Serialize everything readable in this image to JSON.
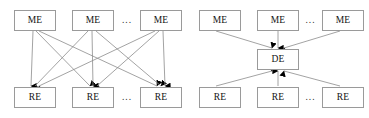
{
  "figure": {
    "type": "diagram",
    "background_color": "#ffffff",
    "box_border_color": "#9a9a9a",
    "edge_color": "#8c8c8c",
    "arrowhead_color": "#000000",
    "text_color": "#121212"
  },
  "labels": {
    "me": "ME",
    "re": "RE",
    "de": "DE",
    "ellipsis": "..."
  },
  "panels": [
    {
      "id": "left-panel",
      "name": "fully-connected-diagram",
      "top_nodes": [
        {
          "id": "L-ME-1",
          "label": "ME",
          "x": 14,
          "y": 10,
          "w": 42,
          "h": 21
        },
        {
          "id": "L-ME-2",
          "label": "ME",
          "x": 72,
          "y": 10,
          "w": 42,
          "h": 21
        },
        {
          "id": "L-ME-3",
          "label": "ME",
          "x": 140,
          "y": 10,
          "w": 42,
          "h": 21
        }
      ],
      "bottom_nodes": [
        {
          "id": "L-RE-1",
          "label": "RE",
          "x": 14,
          "y": 87,
          "w": 42,
          "h": 21
        },
        {
          "id": "L-RE-2",
          "label": "RE",
          "x": 72,
          "y": 87,
          "w": 42,
          "h": 21
        },
        {
          "id": "L-RE-3",
          "label": "RE",
          "x": 140,
          "y": 87,
          "w": 42,
          "h": 21
        }
      ],
      "ellipses": [
        {
          "id": "L-top-ellipsis",
          "label": "...",
          "x": 116,
          "y": 10,
          "w": 22,
          "h": 21
        },
        {
          "id": "L-bottom-ellipsis",
          "label": "...",
          "x": 116,
          "y": 87,
          "w": 22,
          "h": 21
        }
      ],
      "edges": [
        {
          "from": "L-ME-1",
          "to": "L-RE-1",
          "arrow": "end"
        },
        {
          "from": "L-ME-1",
          "to": "L-RE-2",
          "arrow": "end"
        },
        {
          "from": "L-ME-1",
          "to": "L-RE-3",
          "arrow": "end"
        },
        {
          "from": "L-ME-2",
          "to": "L-RE-1",
          "arrow": "end"
        },
        {
          "from": "L-ME-2",
          "to": "L-RE-2",
          "arrow": "end"
        },
        {
          "from": "L-ME-2",
          "to": "L-RE-3",
          "arrow": "end"
        },
        {
          "from": "L-ME-3",
          "to": "L-RE-1",
          "arrow": "end"
        },
        {
          "from": "L-ME-3",
          "to": "L-RE-2",
          "arrow": "end"
        },
        {
          "from": "L-ME-3",
          "to": "L-RE-3",
          "arrow": "end"
        }
      ],
      "edge_count": 9
    },
    {
      "id": "right-panel",
      "name": "hub-mediated-diagram",
      "top_nodes": [
        {
          "id": "R-ME-1",
          "label": "ME",
          "x": 199,
          "y": 10,
          "w": 42,
          "h": 21
        },
        {
          "id": "R-ME-2",
          "label": "ME",
          "x": 257,
          "y": 10,
          "w": 42,
          "h": 21
        },
        {
          "id": "R-ME-3",
          "label": "ME",
          "x": 322,
          "y": 10,
          "w": 42,
          "h": 21
        }
      ],
      "hub_node": {
        "id": "R-DE",
        "label": "DE",
        "x": 257,
        "y": 49,
        "w": 42,
        "h": 21
      },
      "bottom_nodes": [
        {
          "id": "R-RE-1",
          "label": "RE",
          "x": 199,
          "y": 87,
          "w": 42,
          "h": 21
        },
        {
          "id": "R-RE-2",
          "label": "RE",
          "x": 257,
          "y": 87,
          "w": 42,
          "h": 21
        },
        {
          "id": "R-RE-3",
          "label": "RE",
          "x": 322,
          "y": 87,
          "w": 42,
          "h": 21
        }
      ],
      "ellipses": [
        {
          "id": "R-top-ellipsis",
          "label": "...",
          "x": 300,
          "y": 10,
          "w": 21,
          "h": 21
        },
        {
          "id": "R-bottom-ellipsis",
          "label": "...",
          "x": 300,
          "y": 87,
          "w": 21,
          "h": 21
        }
      ],
      "edges": [
        {
          "from": "R-ME-1",
          "to": "R-DE",
          "arrow": "end"
        },
        {
          "from": "R-ME-2",
          "to": "R-DE",
          "arrow": "end"
        },
        {
          "from": "R-ME-3",
          "to": "R-DE",
          "arrow": "end"
        },
        {
          "from": "R-RE-1",
          "to": "R-DE",
          "arrow": "end"
        },
        {
          "from": "R-RE-2",
          "to": "R-DE",
          "arrow": "end"
        },
        {
          "from": "R-RE-3",
          "to": "R-DE",
          "arrow": "end"
        }
      ],
      "edge_count": 6
    }
  ]
}
